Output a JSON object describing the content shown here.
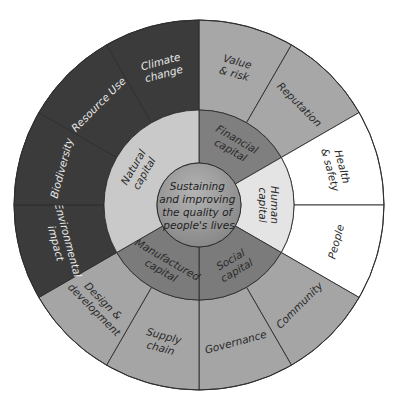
{
  "diagram": {
    "title": "Sustaining and improving the quality of people's lives",
    "geometry": {
      "cx": 199,
      "cy": 205,
      "r_outer": 185,
      "r_middle": 95,
      "r_center": 42
    },
    "center": {
      "lines": [
        "Sustaining",
        "and improving",
        "the quality of",
        "people's lives"
      ],
      "color_top": "#b4b4b4",
      "color_bottom": "#858585"
    },
    "capitals": [
      {
        "id": "financial",
        "label_lines": [
          "Financial",
          "capital"
        ],
        "start": 0,
        "end": 60,
        "inner_color": "#7f7f7f",
        "outer_color": "#a7a7a7",
        "text_theme": "light",
        "topics": [
          {
            "label_lines": [
              "Value",
              "& risk"
            ],
            "start": 0,
            "end": 30
          },
          {
            "label_lines": [
              "Reputation"
            ],
            "start": 30,
            "end": 60
          }
        ]
      },
      {
        "id": "human",
        "label_lines": [
          "Human",
          "capital"
        ],
        "start": 60,
        "end": 120,
        "inner_color": "#e4e4e4",
        "outer_color": "#ffffff",
        "text_theme": "light",
        "topics": [
          {
            "label_lines": [
              "Health",
              "& safety"
            ],
            "start": 60,
            "end": 90
          },
          {
            "label_lines": [
              "People"
            ],
            "start": 90,
            "end": 120
          }
        ]
      },
      {
        "id": "social",
        "label_lines": [
          "Social",
          "capital"
        ],
        "start": 120,
        "end": 180,
        "inner_color": "#7b7b7b",
        "outer_color": "#a5a5a5",
        "text_theme": "light",
        "topics": [
          {
            "label_lines": [
              "Community"
            ],
            "start": 120,
            "end": 150
          },
          {
            "label_lines": [
              "Governance"
            ],
            "start": 150,
            "end": 180
          }
        ]
      },
      {
        "id": "manufactured",
        "label_lines": [
          "Manufactured",
          "capital"
        ],
        "start": 180,
        "end": 240,
        "inner_color": "#7b7b7b",
        "outer_color": "#a5a5a5",
        "text_theme": "light",
        "topics": [
          {
            "label_lines": [
              "Supply",
              "chain"
            ],
            "start": 180,
            "end": 210
          },
          {
            "label_lines": [
              "Design &",
              "development"
            ],
            "start": 210,
            "end": 240
          }
        ]
      },
      {
        "id": "natural",
        "label_lines": [
          "Natural",
          "capital"
        ],
        "start": 240,
        "end": 360,
        "inner_color": "#c9c9c9",
        "outer_color": "#3b3b3b",
        "text_theme": "dark",
        "topics": [
          {
            "label_lines": [
              "Environmental",
              "impact"
            ],
            "start": 240,
            "end": 270
          },
          {
            "label_lines": [
              "Biodiversity"
            ],
            "start": 270,
            "end": 300
          },
          {
            "label_lines": [
              "Resource Use"
            ],
            "start": 300,
            "end": 330
          },
          {
            "label_lines": [
              "Climate",
              "change"
            ],
            "start": 330,
            "end": 360
          }
        ]
      }
    ]
  }
}
